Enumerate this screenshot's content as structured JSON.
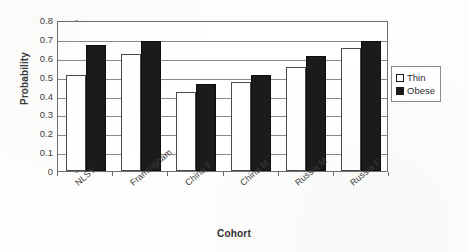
{
  "chart_data": {
    "type": "bar",
    "title": "",
    "xlabel": "Cohort",
    "ylabel": "Probability",
    "categories": [
      "NLSY",
      "Framingham",
      "China F",
      "China M",
      "Russia M",
      "Russia F"
    ],
    "series": [
      {
        "name": "Thin",
        "values": [
          0.51,
          0.62,
          0.42,
          0.47,
          0.55,
          0.65
        ],
        "color": "#ffffff"
      },
      {
        "name": "Obese",
        "values": [
          0.67,
          0.69,
          0.46,
          0.51,
          0.61,
          0.69
        ],
        "color": "#1b1b1b"
      }
    ],
    "ylim": [
      0,
      0.8
    ],
    "yticks": [
      "0",
      "0.1",
      "0.2",
      "0.3",
      "0.4",
      "0.5",
      "0.6",
      "0.7",
      "0.8"
    ],
    "grid": "horizontal",
    "legend_position": "right"
  },
  "legend": {
    "items": [
      {
        "label": "Thin",
        "swatch": "white-square-icon"
      },
      {
        "label": "Obese",
        "swatch": "black-square-icon"
      }
    ]
  }
}
